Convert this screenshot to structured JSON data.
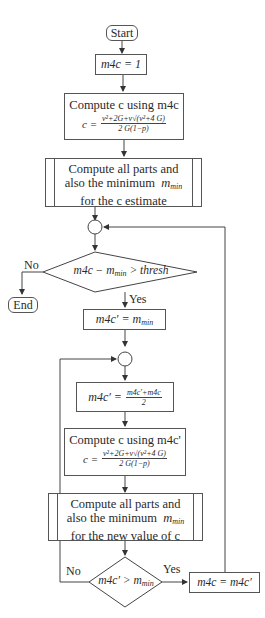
{
  "flowchart": {
    "start": "Start",
    "end": "End",
    "init": "m4c = 1",
    "compute_c": {
      "title": "Compute c using m4c",
      "lhs": "c =",
      "numerator": "v²+2G+v√(v²+4 G)",
      "denominator": "2 G(1−p)"
    },
    "compute_parts_1": {
      "line1": "Compute all parts and",
      "line2_prefix": "also the minimum",
      "line2_var": "m",
      "line2_sub": "min",
      "line3": "for the c estimate"
    },
    "decision_1": {
      "prefix": "m4c − m",
      "sub": "min",
      "suffix": " > thresh",
      "no_label": "No",
      "yes_label": "Yes"
    },
    "assign_1": {
      "lhs": "m4c′ = m",
      "sub": "min"
    },
    "update": {
      "lhs": "m4c′ =",
      "numerator": "m4c′+m4c",
      "denominator": "2"
    },
    "compute_c2": {
      "title": "Compute c using m4c'",
      "lhs": "c =",
      "numerator": "v²+2G+v√(v²+4 G)",
      "denominator": "2 G(1−p)"
    },
    "compute_parts_2": {
      "line1": "Compute all parts and",
      "line2_prefix": "also the minimum",
      "line2_var": "m",
      "line2_sub": "min",
      "line3": "for the new value of c"
    },
    "decision_2": {
      "prefix": "m4c′ > m",
      "sub": "min",
      "no_label": "No",
      "yes_label": "Yes"
    },
    "assign_2": "m4c = m4c′"
  },
  "colors": {
    "line": "#444444",
    "text": "#2a2a2a",
    "background": "#ffffff"
  }
}
